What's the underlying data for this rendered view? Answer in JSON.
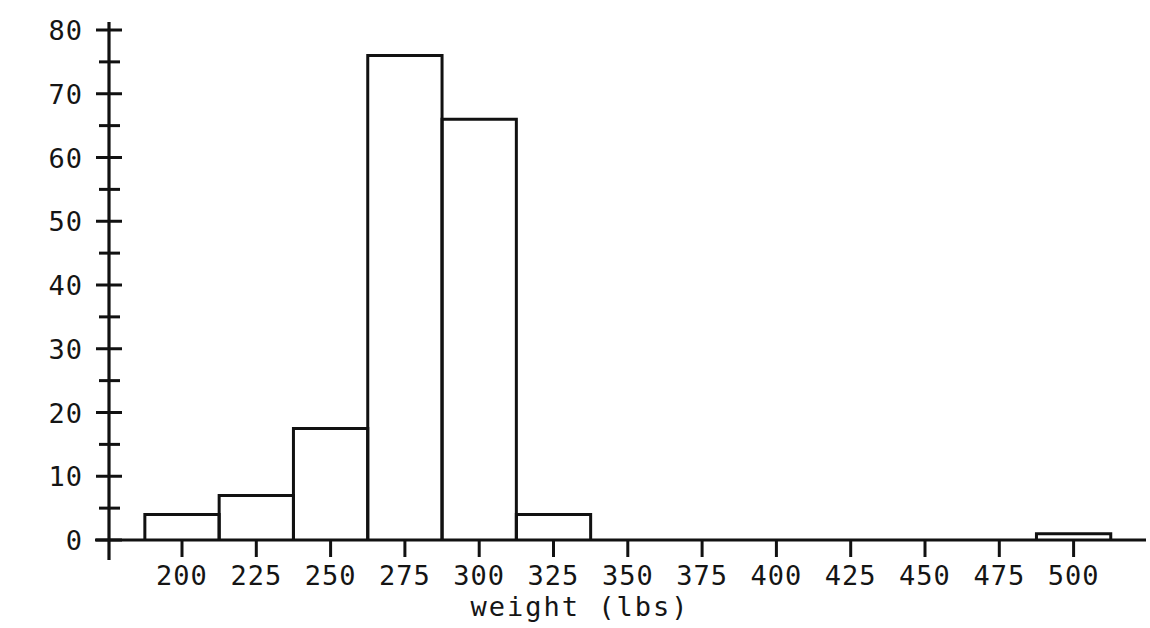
{
  "chart_data": {
    "type": "bar",
    "title": "",
    "subtitle": "",
    "xlabel": "weight  (lbs)",
    "ylabel": "",
    "grid": false,
    "legend": null,
    "style": "histogram with open (unfilled) bars, black outlines on white background",
    "bin_width": 25,
    "xlim": [
      182,
      518
    ],
    "ylim": [
      0,
      80
    ],
    "x_major_ticks": [
      200,
      225,
      250,
      275,
      300,
      325,
      350,
      375,
      400,
      425,
      450,
      475,
      500
    ],
    "x_tick_labels": [
      "200",
      "225",
      "250",
      "275",
      "300",
      "325",
      "350",
      "375",
      "400",
      "425",
      "450",
      "475",
      "500"
    ],
    "y_major_ticks": [
      0,
      10,
      20,
      30,
      40,
      50,
      60,
      70,
      80
    ],
    "y_tick_labels": [
      "0",
      "10",
      "20",
      "30",
      "40",
      "50",
      "60",
      "70",
      "80"
    ],
    "y_minor_ticks": [
      5,
      15,
      25,
      35,
      45,
      55,
      65,
      75
    ],
    "bins": [
      {
        "start": 187.5,
        "end": 212.5,
        "count": 4
      },
      {
        "start": 212.5,
        "end": 237.5,
        "count": 7
      },
      {
        "start": 237.5,
        "end": 262.5,
        "count": 17.5
      },
      {
        "start": 262.5,
        "end": 287.5,
        "count": 76
      },
      {
        "start": 287.5,
        "end": 312.5,
        "count": 66
      },
      {
        "start": 312.5,
        "end": 337.5,
        "count": 4
      },
      {
        "start": 487.5,
        "end": 512.5,
        "count": 1
      }
    ],
    "bin_starts": [
      187.5,
      212.5,
      237.5,
      262.5,
      287.5,
      312.5,
      487.5
    ],
    "values": [
      4,
      7,
      17.5,
      76,
      66,
      4,
      1
    ]
  },
  "colors": {
    "ink": "#111111",
    "background": "#ffffff"
  }
}
